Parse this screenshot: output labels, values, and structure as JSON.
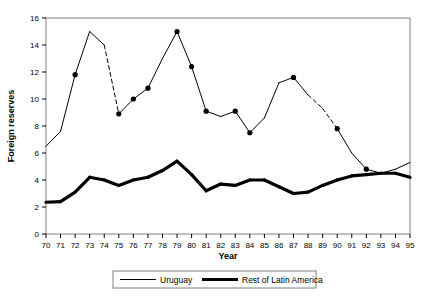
{
  "chart_data": {
    "type": "line",
    "title": "",
    "xlabel": "Year",
    "ylabel": "Foreign reserves",
    "xlim": [
      70,
      95
    ],
    "ylim": [
      0,
      16
    ],
    "ytick_step": 2,
    "grid": false,
    "legend_position": "bottom-center",
    "x": [
      70,
      71,
      72,
      73,
      74,
      75,
      76,
      77,
      78,
      79,
      80,
      81,
      82,
      83,
      84,
      85,
      86,
      87,
      88,
      89,
      90,
      91,
      92,
      93,
      94,
      95
    ],
    "xtick_labels": [
      "70",
      "71",
      "72",
      "73",
      "74",
      "75",
      "76",
      "77",
      "78",
      "79",
      "80",
      "81",
      "82",
      "83",
      "84",
      "85",
      "86",
      "87",
      "88",
      "89",
      "90",
      "91",
      "92",
      "93",
      "94",
      "95"
    ],
    "ytick_labels": [
      "0",
      "2",
      "4",
      "6",
      "8",
      "10",
      "12",
      "14",
      "16"
    ],
    "series": [
      {
        "name": "Uruguay",
        "style": "thin",
        "values": [
          6.5,
          7.6,
          11.8,
          15.0,
          14.0,
          8.9,
          10.0,
          10.8,
          13.0,
          15.0,
          12.4,
          9.1,
          8.7,
          9.1,
          7.5,
          8.6,
          11.2,
          11.6,
          10.3,
          9.3,
          7.8,
          6.0,
          4.8,
          4.5,
          4.8,
          5.3
        ],
        "markers_at_years": [
          72,
          75,
          76,
          77,
          79,
          80,
          81,
          83,
          84,
          87,
          90,
          92
        ],
        "dashed_segments": [
          [
            74,
            75
          ],
          [
            88,
            90
          ]
        ]
      },
      {
        "name": "Rest of Latin America",
        "style": "thick",
        "values": [
          2.35,
          2.4,
          3.1,
          4.2,
          4.0,
          3.6,
          4.0,
          4.2,
          4.7,
          5.4,
          4.4,
          3.2,
          3.7,
          3.6,
          4.0,
          4.0,
          3.5,
          3.0,
          3.1,
          3.6,
          4.0,
          4.3,
          4.4,
          4.5,
          4.5,
          4.2
        ],
        "markers_at_years": [],
        "dashed_segments": []
      }
    ]
  },
  "legend": {
    "entries": [
      {
        "label": "Uruguay",
        "style": "thin"
      },
      {
        "label": "Rest of Latin America",
        "style": "thick"
      }
    ]
  },
  "colors": {
    "line": "#000000",
    "frame": "#808080",
    "background": "#ffffff"
  }
}
